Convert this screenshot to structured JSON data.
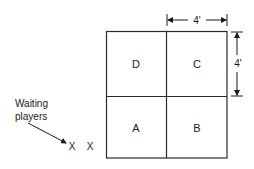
{
  "diagram": {
    "grid": {
      "left": 106,
      "top": 31,
      "right": 227,
      "bottom": 158,
      "mid_x": 166,
      "mid_y": 96,
      "line_color": "#2a2a2a"
    },
    "squares": [
      {
        "label": "D",
        "position": "top-left"
      },
      {
        "label": "C",
        "position": "top-right"
      },
      {
        "label": "A",
        "position": "bottom-left"
      },
      {
        "label": "B",
        "position": "bottom-right"
      }
    ],
    "dimensions": {
      "horizontal": {
        "label": "4'"
      },
      "vertical": {
        "label": "4'"
      }
    },
    "waiting_players": {
      "label_line1": "Waiting",
      "label_line2": "players",
      "markers": [
        "X",
        "X"
      ]
    }
  }
}
